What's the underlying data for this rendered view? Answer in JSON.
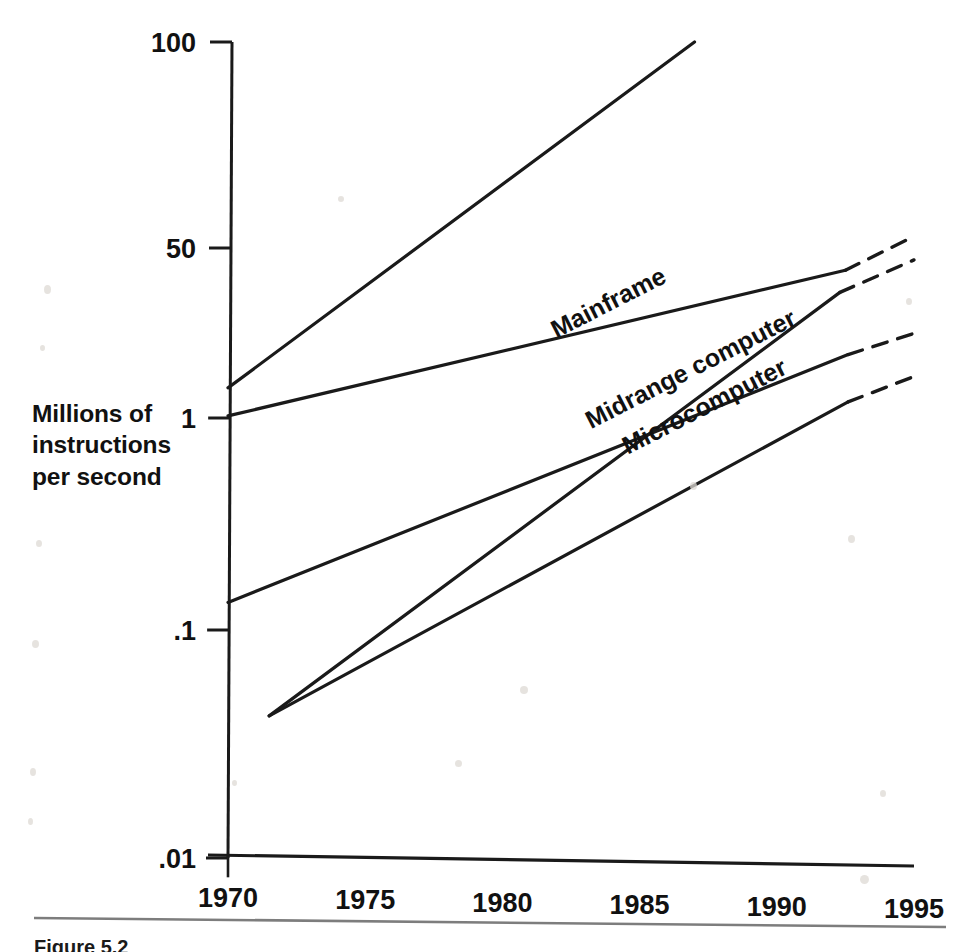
{
  "figure": {
    "caption_fragment": "Figure 5.2",
    "divider_color": "#7d7d7d"
  },
  "axis": {
    "y_title_lines": [
      "Millions of",
      "instructions",
      "per second"
    ],
    "y_ticks": [
      {
        "label": "100",
        "value": 100
      },
      {
        "label": "50",
        "value": 50
      },
      {
        "label": "1",
        "value": 1
      },
      {
        "label": ".1",
        "value": 0.1
      },
      {
        "label": ".01",
        "value": 0.01
      }
    ],
    "x_ticks_major": [
      "1970",
      "1975",
      "1980",
      "1985",
      "1990",
      "1995"
    ],
    "x_range": [
      1970,
      1995
    ],
    "x_minor_step": 1
  },
  "series_labels": [
    {
      "name": "mainframe",
      "text": "Mainframe"
    },
    {
      "name": "midrange-computer",
      "text": "Midrange computer"
    },
    {
      "name": "microcomputer",
      "text": "Microcomputer"
    }
  ],
  "chart_data": {
    "type": "line",
    "title": "",
    "subtitle": "",
    "xlabel": "",
    "ylabel": "Millions of instructions per second",
    "xlim": [
      1970,
      1995
    ],
    "ylim": [
      0.01,
      100
    ],
    "yscale": "log",
    "grid": false,
    "legend": "inline-labels",
    "axis_tick_labels": {
      "y": [
        "100",
        "50",
        "1",
        ".1",
        ".01"
      ],
      "x": [
        "1970",
        "1975",
        "1980",
        "1985",
        "1990",
        "1995"
      ]
    },
    "annotations": [
      {
        "text": "Mainframe",
        "x": 1984.0,
        "y": 12.0,
        "rotation": -27
      },
      {
        "text": "Midrange computer",
        "x": 1987.0,
        "y": 2.6,
        "rotation": -27
      },
      {
        "text": "Microcomputer",
        "x": 1987.5,
        "y": 1.1,
        "rotation": -27
      }
    ],
    "series": [
      {
        "name": "Mainframe (top)",
        "label": "Mainframe",
        "style": "solid",
        "points": [
          [
            1970,
            2.0
          ],
          [
            1987,
            100.0
          ]
        ]
      },
      {
        "name": "Mainframe (lower)",
        "label": "",
        "style": "solid",
        "points": [
          [
            1970,
            1.05
          ],
          [
            1992.5,
            30.0
          ]
        ],
        "projection": {
          "style": "dashed",
          "points": [
            [
              1992.5,
              30.0
            ],
            [
              1995,
              52.0
            ]
          ]
        }
      },
      {
        "name": "Midrange computer",
        "label": "Midrange computer",
        "style": "solid",
        "points": [
          [
            1971.5,
            0.042
          ],
          [
            1992.3,
            18.0
          ]
        ],
        "projection": {
          "style": "dashed",
          "points": [
            [
              1992.3,
              18.0
            ],
            [
              1995,
              38.0
            ]
          ]
        }
      },
      {
        "name": "Midrange computer (lower)",
        "label": "",
        "style": "solid",
        "points": [
          [
            1970,
            0.135
          ],
          [
            1992.6,
            4.3
          ]
        ],
        "projection": {
          "style": "dashed",
          "points": [
            [
              1992.6,
              4.3
            ],
            [
              1995,
              7.0
            ]
          ]
        }
      },
      {
        "name": "Microcomputer",
        "label": "Microcomputer",
        "style": "solid",
        "points": [
          [
            1971.5,
            0.042
          ],
          [
            1992.6,
            1.45
          ]
        ],
        "projection": {
          "style": "dashed",
          "points": [
            [
              1992.6,
              1.45
            ],
            [
              1995,
              2.6
            ]
          ]
        }
      }
    ]
  }
}
